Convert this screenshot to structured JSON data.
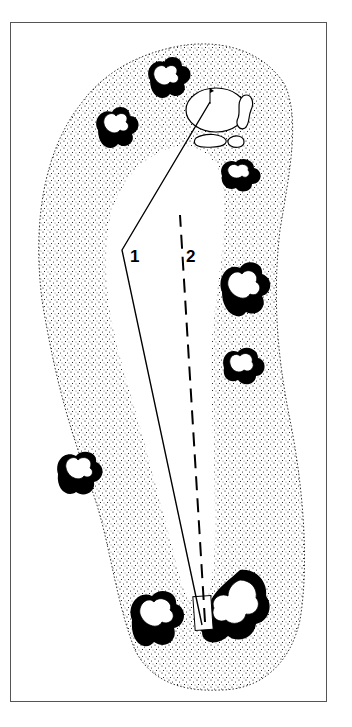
{
  "diagram": {
    "type": "golf-hole-layout",
    "route_labels": [
      {
        "id": "route-1",
        "label": "1",
        "style": "solid"
      },
      {
        "id": "route-2",
        "label": "2",
        "style": "dashed"
      }
    ],
    "elements": [
      "tee-box",
      "fairway",
      "rough",
      "green",
      "bunkers",
      "flagstick",
      "tree-clusters"
    ],
    "colors": {
      "ink": "#000000",
      "paper": "#ffffff",
      "frame": "#555555"
    }
  }
}
